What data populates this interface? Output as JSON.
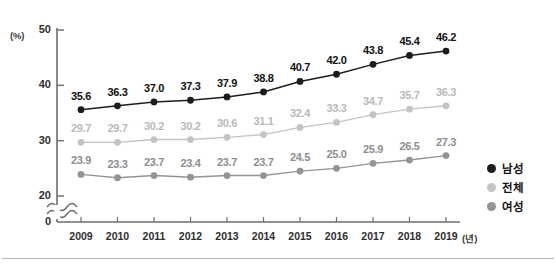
{
  "axes": {
    "y_unit": "(%)",
    "y_ticks": [
      "50",
      "40",
      "30",
      "20",
      "0"
    ],
    "x_unit": "(년)",
    "x_ticks": [
      "2009",
      "2010",
      "2011",
      "2012",
      "2013",
      "2014",
      "2015",
      "2016",
      "2017",
      "2018",
      "2019"
    ]
  },
  "legend": {
    "items": [
      {
        "label": "남성",
        "color": "#1c1c1c"
      },
      {
        "label": "전체",
        "color": "#c4c4c4"
      },
      {
        "label": "여성",
        "color": "#949494"
      }
    ]
  },
  "chart_data": {
    "type": "line",
    "title": "",
    "subtitle": "",
    "xlabel": "(년)",
    "ylabel": "(%)",
    "x": [
      "2009",
      "2010",
      "2011",
      "2012",
      "2013",
      "2014",
      "2015",
      "2016",
      "2017",
      "2018",
      "2019"
    ],
    "ylim": [
      20,
      50
    ],
    "y_broken_axis": true,
    "y_break_between": [
      0,
      20
    ],
    "yticks": [
      20,
      30,
      40,
      50
    ],
    "grid": false,
    "legend_position": "right",
    "series": [
      {
        "name": "남성",
        "color": "#1c1c1c",
        "label_color": "#111111",
        "values": [
          35.6,
          36.3,
          37.0,
          37.3,
          37.9,
          38.8,
          40.7,
          42.0,
          43.8,
          45.4,
          46.2
        ],
        "labels": [
          "35.6",
          "36.3",
          "37.0",
          "37.3",
          "37.9",
          "38.8",
          "40.7",
          "42.0",
          "43.8",
          "45.4",
          "46.2"
        ]
      },
      {
        "name": "전체",
        "color": "#c4c4c4",
        "label_color": "#b9b9b9",
        "values": [
          29.7,
          29.7,
          30.2,
          30.2,
          30.6,
          31.1,
          32.4,
          33.3,
          34.7,
          35.7,
          36.3
        ],
        "labels": [
          "29.7",
          "29.7",
          "30.2",
          "30.2",
          "30.6",
          "31.1",
          "32.4",
          "33.3",
          "34.7",
          "35.7",
          "36.3"
        ]
      },
      {
        "name": "여성",
        "color": "#949494",
        "label_color": "#8e8e8e",
        "values": [
          23.9,
          23.3,
          23.7,
          23.4,
          23.7,
          23.7,
          24.5,
          25.0,
          25.9,
          26.5,
          27.3
        ],
        "labels": [
          "23.9",
          "23.3",
          "23.7",
          "23.4",
          "23.7",
          "23.7",
          "24.5",
          "25.0",
          "25.9",
          "26.5",
          "27.3"
        ]
      }
    ]
  }
}
